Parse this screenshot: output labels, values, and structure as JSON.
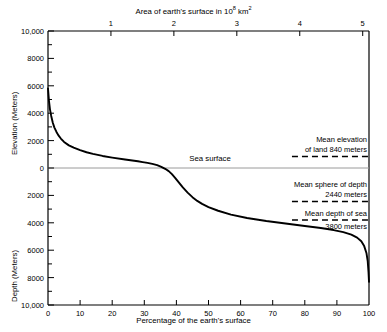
{
  "chart_data": {
    "type": "line",
    "top_axis_label": "Area of earth's surface in 10",
    "top_axis_label_exp": "8",
    "top_axis_label_unit": " km",
    "top_axis_unit_exp": "2",
    "xlabel": "Percentage of the earth's surface",
    "ylabel_upper": "Elevation (Meters)",
    "ylabel_lower": "Depth (Meters)",
    "xlim": [
      0,
      100
    ],
    "ylim": [
      -10000,
      10000
    ],
    "grid": false,
    "legend": "none",
    "top_ticks": [
      1,
      2,
      3,
      4,
      5
    ],
    "top_tick_labels": [
      "1",
      "2",
      "3",
      "4",
      "5"
    ],
    "top_axis_max": 5.1,
    "bottom_ticks": [
      0,
      10,
      20,
      30,
      40,
      50,
      60,
      70,
      80,
      90,
      100
    ],
    "bottom_tick_labels": [
      "0",
      "10",
      "20",
      "30",
      "40",
      "50",
      "60",
      "70",
      "80",
      "90",
      "100"
    ],
    "y_ticks_major": [
      10000,
      8000,
      6000,
      4000,
      2000,
      0,
      -2000,
      -4000,
      -6000,
      -8000,
      -10000
    ],
    "y_tick_labels": [
      "10,000",
      "8000",
      "6000",
      "4000",
      "2000",
      "0",
      "2000",
      "4000",
      "6000",
      "8000",
      "10,000"
    ],
    "y_ticks_minor": [
      9000,
      7000,
      5000,
      3000,
      1000,
      -1000,
      -3000,
      -5000,
      -7000,
      -9000
    ],
    "series": [
      {
        "name": "Hypsographic curve",
        "x": [
          0,
          0.3,
          0.6,
          1.0,
          1.5,
          2.0,
          2.6,
          3.2,
          4.0,
          5.0,
          6.5,
          8.0,
          10.0,
          12.0,
          14.0,
          17.0,
          20.0,
          24.0,
          28.0,
          29.5,
          31.0,
          32.5,
          34.0,
          35.3,
          36.5,
          37.6,
          38.6,
          39.6,
          40.8,
          42.0,
          43.5,
          45.0,
          46.5,
          48.0,
          50.0,
          53.0,
          57.0,
          62.0,
          68.0,
          74.0,
          80.0,
          85.0,
          89.0,
          92.0,
          94.5,
          96.3,
          97.6,
          98.5,
          99.2,
          99.6,
          99.85,
          100.0
        ],
        "y": [
          5800,
          4900,
          4300,
          3800,
          3300,
          2950,
          2650,
          2400,
          2150,
          1900,
          1650,
          1480,
          1300,
          1150,
          1030,
          880,
          760,
          620,
          490,
          430,
          370,
          300,
          210,
          80,
          -60,
          -230,
          -450,
          -720,
          -1070,
          -1420,
          -1800,
          -2130,
          -2400,
          -2620,
          -2850,
          -3120,
          -3400,
          -3650,
          -3870,
          -4050,
          -4230,
          -4380,
          -4530,
          -4680,
          -4870,
          -5080,
          -5350,
          -5700,
          -6200,
          -6800,
          -7600,
          -8300
        ]
      }
    ],
    "reference_lines": [
      {
        "name": "mean-elevation-of-land",
        "label_line1": "Mean elevation",
        "label_line2": "of land 840 meters",
        "value": 840,
        "style": "dashed",
        "x_start": 76,
        "x_end": 100
      },
      {
        "name": "mean-sphere-of-depth",
        "label_line1": "Mean sphere of depth",
        "label_line2": "2440 meters",
        "value": -2440,
        "style": "dashed",
        "x_start": 76,
        "x_end": 100
      },
      {
        "name": "mean-depth-of-sea",
        "label_line1": "Mean depth of sea",
        "label_line2": "3800 meters",
        "value": -3800,
        "style": "dashed",
        "x_start": 76,
        "x_end": 100
      }
    ],
    "sea_surface": {
      "label": "Sea surface",
      "value": 0,
      "style": "solid-gray"
    }
  }
}
